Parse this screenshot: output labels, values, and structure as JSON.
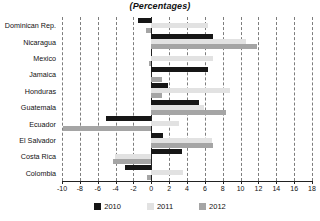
{
  "chart_data": {
    "type": "bar",
    "orientation": "horizontal",
    "title": "(Percentages)",
    "xlabel": "",
    "ylabel": "",
    "xlim": [
      -10,
      18
    ],
    "xticks": [
      -10,
      -8,
      -6,
      -4,
      -2,
      0,
      2,
      4,
      6,
      8,
      10,
      12,
      14,
      16,
      18
    ],
    "xtick_labels": [
      "-10",
      "-8",
      "-6",
      "-4",
      "-2",
      "0",
      "2",
      "4",
      "6",
      "8",
      "10",
      "12",
      "14",
      "16",
      "18"
    ],
    "grid": true,
    "grid_style": "vertical-dashed",
    "legend_position": "bottom-center",
    "categories": [
      "Dominican Rep.",
      "Nicaragua",
      "Mexico",
      "Jamaica",
      "Honduras",
      "Guatemala",
      "Ecuador",
      "El Salvador",
      "Costa Rica",
      "Colombia"
    ],
    "series": [
      {
        "name": "2010",
        "color": "#161616",
        "values": [
          -1.5,
          6.9,
          0.0,
          6.3,
          1.9,
          5.4,
          -5.1,
          1.3,
          3.4,
          -3.0
        ]
      },
      {
        "name": "2011",
        "color": "#e2e2e2",
        "values": [
          6.4,
          10.6,
          6.9,
          0.0,
          8.8,
          5.9,
          3.1,
          6.8,
          -4.1,
          3.5
        ]
      },
      {
        "name": "2012",
        "color": "#a5a5a5",
        "values": [
          -0.6,
          11.8,
          -0.3,
          1.2,
          1.2,
          8.4,
          -9.9,
          6.9,
          -4.3,
          -0.5
        ]
      }
    ]
  },
  "legend": {
    "items": [
      {
        "label": "2010",
        "color": "#161616"
      },
      {
        "label": "2011",
        "color": "#e2e2e2"
      },
      {
        "label": "2012",
        "color": "#a5a5a5"
      }
    ]
  }
}
